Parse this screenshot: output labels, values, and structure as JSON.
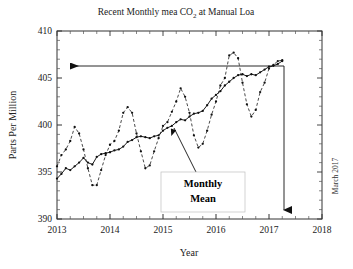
{
  "figure": {
    "title": "Recent Monthly mea CO",
    "title_sub": "2",
    "title_tail": " at Manual Loa",
    "side_note": "March 2017",
    "annotation": {
      "line1": "Monthly",
      "line2": "Mean"
    }
  },
  "chart_data": {
    "type": "line",
    "title": "Recent Monthly mea CO2 at Manual Loa",
    "xlabel": "Year",
    "ylabel": "Parts Per Million",
    "xlim": [
      2013,
      2018
    ],
    "ylim": [
      390,
      410
    ],
    "xticks": [
      "2013",
      "2014",
      "2015",
      "2016",
      "2017",
      "2018"
    ],
    "yticks": [
      "390",
      "395",
      "400",
      "405",
      "410"
    ],
    "grid": false,
    "legend": "none",
    "minor_ticks": true,
    "annotations": [
      {
        "text": "Monthly Mean",
        "points_to_x": 2015.25,
        "points_to_y": 400.3
      },
      {
        "text": "March 2017",
        "orientation": "vertical",
        "position": "right-outside"
      },
      {
        "text": "horizontal-arrow-left",
        "from_x": 2017.25,
        "to_x": 2013.28,
        "at_y": 408.1
      },
      {
        "text": "vertical-arrow-down",
        "at_x": 2017.25,
        "from_y": 408.1,
        "to_y": 391.3
      }
    ],
    "x": [
      2013.0,
      2013.083,
      2013.167,
      2013.25,
      2013.333,
      2013.417,
      2013.5,
      2013.583,
      2013.667,
      2013.75,
      2013.833,
      2013.917,
      2014.0,
      2014.083,
      2014.167,
      2014.25,
      2014.333,
      2014.417,
      2014.5,
      2014.583,
      2014.667,
      2014.75,
      2014.833,
      2014.917,
      2015.0,
      2015.083,
      2015.167,
      2015.25,
      2015.333,
      2015.417,
      2015.5,
      2015.583,
      2015.667,
      2015.75,
      2015.833,
      2015.917,
      2016.0,
      2016.083,
      2016.167,
      2016.25,
      2016.333,
      2016.417,
      2016.5,
      2016.583,
      2016.667,
      2016.75,
      2016.833,
      2016.917,
      2017.0,
      2017.083,
      2017.167,
      2017.25
    ],
    "series": [
      {
        "name": "Monthly Mean",
        "style": "dashed",
        "marker": "dot",
        "values": [
          395.6,
          396.8,
          397.4,
          398.3,
          399.8,
          399.1,
          397.4,
          395.4,
          393.6,
          393.6,
          395.2,
          396.8,
          397.9,
          398.3,
          399.4,
          401.3,
          401.9,
          401.3,
          399.1,
          397.2,
          395.4,
          395.7,
          397.2,
          398.6,
          399.9,
          400.3,
          401.4,
          402.5,
          403.9,
          403.0,
          401.3,
          398.9,
          397.6,
          398.0,
          399.4,
          401.1,
          402.5,
          404.2,
          405.0,
          407.4,
          407.7,
          407.1,
          404.5,
          402.2,
          400.9,
          401.6,
          403.5,
          404.5,
          406.0,
          406.4,
          406.8,
          406.9
        ]
      },
      {
        "name": "Trend",
        "style": "solid",
        "marker": "dot",
        "values": [
          394.3,
          394.8,
          395.4,
          395.2,
          395.6,
          396.0,
          396.5,
          396.0,
          395.8,
          396.6,
          396.9,
          397.0,
          397.1,
          397.3,
          397.4,
          397.7,
          398.2,
          398.4,
          398.7,
          398.8,
          398.7,
          398.6,
          398.8,
          398.9,
          399.4,
          399.7,
          399.9,
          400.3,
          400.6,
          400.5,
          400.9,
          401.2,
          401.3,
          401.5,
          402.1,
          402.8,
          403.2,
          403.6,
          404.2,
          404.6,
          405.0,
          405.3,
          405.4,
          405.2,
          405.4,
          405.3,
          405.6,
          405.9,
          406.2,
          406.3,
          406.5,
          406.8
        ]
      }
    ]
  }
}
